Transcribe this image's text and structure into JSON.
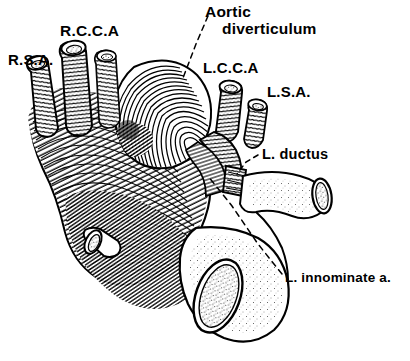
{
  "figure": {
    "style": "pen-and-ink medical illustration, black line hatching on white",
    "background_color": "#ffffff",
    "ink_color": "#000000",
    "width": 410,
    "height": 361
  },
  "labels": {
    "rsa": "R.S.A.",
    "rcca": "R.C.C.A",
    "aortic_line1": "Aortic",
    "aortic_line2": "diverticulum",
    "lcca": "L.C.C.A",
    "lsa": "L.S.A.",
    "ductus": "L. ductus",
    "innominate": "L. innominate a."
  },
  "structures": [
    {
      "name": "right-subclavian-artery",
      "abbrev": "R.S.A.",
      "texture": "corrugated-ribbed",
      "cut_end": true
    },
    {
      "name": "right-common-carotid-artery",
      "abbrev": "R.C.C.A",
      "texture": "corrugated-ribbed",
      "cut_end": true
    },
    {
      "name": "aortic-diverticulum",
      "abbrev": "",
      "texture": "concentric-hatching",
      "cut_end": false
    },
    {
      "name": "left-common-carotid-artery",
      "abbrev": "L.C.C.A",
      "texture": "corrugated-ribbed",
      "cut_end": true
    },
    {
      "name": "left-subclavian-artery",
      "abbrev": "L.S.A.",
      "texture": "corrugated-ribbed",
      "cut_end": true
    },
    {
      "name": "left-ductus-arteriosus",
      "abbrev": "L. ductus",
      "texture": "short-ribbed-segment",
      "cut_end": false
    },
    {
      "name": "left-innominate-artery",
      "abbrev": "L. innominate a.",
      "texture": "stippled",
      "cut_end": true
    },
    {
      "name": "aortic-arch-body",
      "abbrev": "",
      "texture": "dense-curved-hatching",
      "cut_end": false
    },
    {
      "name": "descending-branch-stump",
      "abbrev": "",
      "texture": "stippled-lumen",
      "cut_end": true
    },
    {
      "name": "right-lateral-branch-vessel",
      "abbrev": "",
      "texture": "stippled",
      "cut_end": true
    }
  ],
  "leader_lines": [
    {
      "name": "leader-aortic-diverticulum",
      "style": "dashed",
      "from_label": "aortic_line1",
      "to_structure": "aortic-diverticulum"
    },
    {
      "name": "leader-ductus",
      "style": "dashed",
      "from_label": "ductus",
      "to_structure": "left-ductus-arteriosus"
    },
    {
      "name": "leader-innominate",
      "style": "dashed",
      "from_label": "innominate",
      "to_structure": "left-innominate-artery"
    }
  ]
}
